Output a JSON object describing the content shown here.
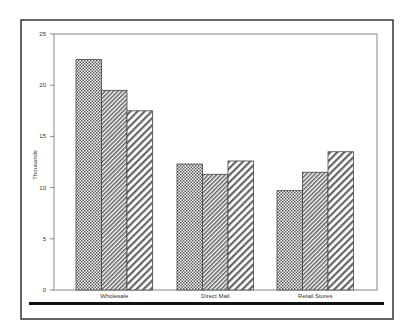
{
  "chart_data": {
    "type": "bar",
    "title": "",
    "xlabel": "",
    "ylabel": "Thousands",
    "ylim": [
      0,
      25
    ],
    "yticks": [
      0,
      5,
      10,
      15,
      20,
      25
    ],
    "grid": false,
    "legend": null,
    "categories": [
      "Wholesale",
      "Direct Mail",
      "Retail Stores"
    ],
    "series": [
      {
        "name": "Series 1",
        "pattern": "crosshatch",
        "values": [
          22.5,
          12.3,
          9.7
        ]
      },
      {
        "name": "Series 2",
        "pattern": "fine-diagonal",
        "values": [
          19.5,
          11.3,
          11.5
        ]
      },
      {
        "name": "Series 3",
        "pattern": "wide-diagonal",
        "values": [
          17.5,
          12.6,
          13.5
        ]
      }
    ]
  },
  "colors": {
    "frame": "#333333",
    "bar_outline": "#444444",
    "pattern": "#555555",
    "rule": "#111111"
  }
}
